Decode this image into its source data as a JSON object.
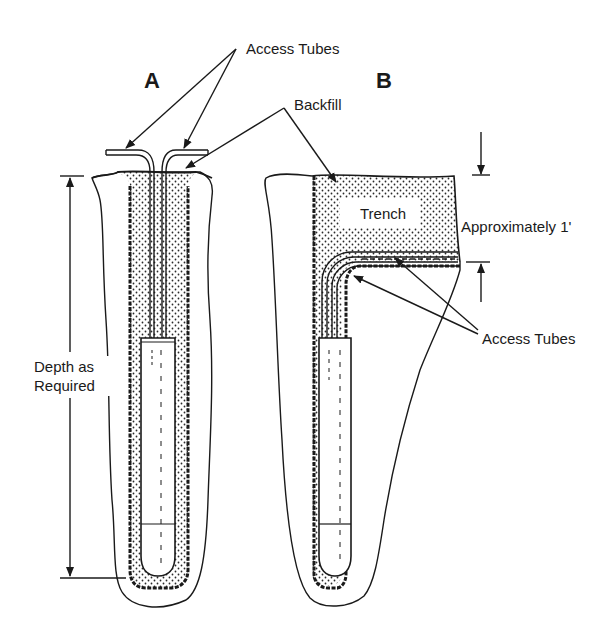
{
  "diagram": {
    "type": "technical-cross-section",
    "panels": [
      {
        "id": "A",
        "label": "A",
        "description": "vertical borehole with access tubes rising straight to surface"
      },
      {
        "id": "B",
        "label": "B",
        "description": "borehole with access tubes bent horizontally into a shallow trench"
      }
    ],
    "labels": {
      "panel_a": "A",
      "panel_b": "B",
      "access_tubes_top": "Access Tubes",
      "backfill": "Backfill",
      "trench": "Trench",
      "approximately": "Approximately 1'",
      "access_tubes_right": "Access Tubes",
      "depth_line1": "Depth as",
      "depth_line2": "Required"
    },
    "colors": {
      "ink": "#1a1a1a",
      "background": "#ffffff",
      "stipple": "#2a2a2a"
    }
  }
}
